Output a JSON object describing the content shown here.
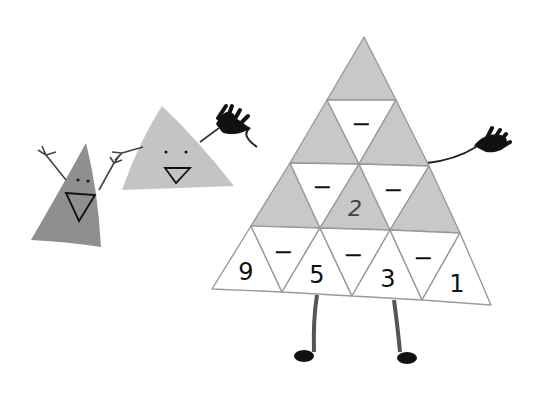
{
  "illustration": {
    "title": "Subtraction triangle puzzle",
    "colors": {
      "shaded_cell": "#c8c8c8",
      "blank_cell": "#ffffff",
      "grid_line": "#9a9a9a",
      "small_char_1": "#8f8f8f",
      "small_char_2": "#c4c4c4",
      "ink": "#111111"
    },
    "puzzle": {
      "operator": "−",
      "bottom_row": [
        "9",
        "5",
        "3",
        "1"
      ],
      "row2_operators": [
        "−",
        "−",
        "−"
      ],
      "row3_value": "2",
      "row3_operators": [
        "−",
        "−"
      ],
      "row4_operators": [
        "−"
      ]
    },
    "characters": [
      {
        "name": "small-dark-triangle",
        "expression": "smiling"
      },
      {
        "name": "small-light-triangle",
        "expression": "smiling"
      },
      {
        "name": "big-puzzle-triangle",
        "expression": "waving"
      }
    ]
  }
}
